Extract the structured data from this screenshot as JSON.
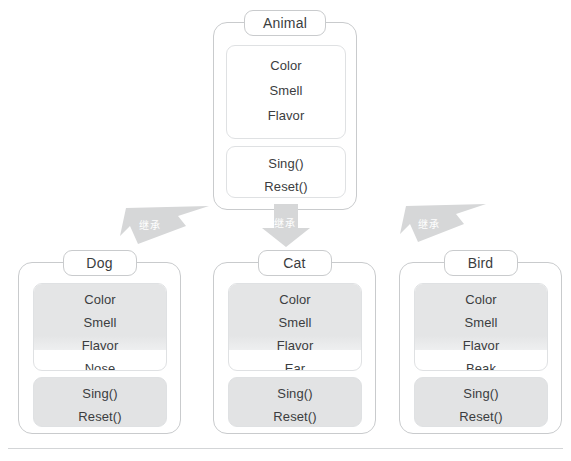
{
  "diagram": {
    "type": "uml-class-inheritance",
    "background_color": "#ffffff",
    "box_border_color": "#c9cbcd",
    "inherited_fill_color": "#e4e5e6",
    "arrow_fill_color": "#d6d7d8",
    "text_color": "#3b3d40"
  },
  "base_class": {
    "name": "Animal",
    "attributes": [
      "Color",
      "Smell",
      "Flavor"
    ],
    "methods": [
      "Sing()",
      "Reset()"
    ]
  },
  "derived_classes": [
    {
      "name": "Dog",
      "inherited_attributes": [
        "Color",
        "Smell",
        "Flavor"
      ],
      "own_attributes": [
        "Nose"
      ],
      "inherited_methods": [
        "Sing()",
        "Reset()"
      ]
    },
    {
      "name": "Cat",
      "inherited_attributes": [
        "Color",
        "Smell",
        "Flavor"
      ],
      "own_attributes": [
        "Ear"
      ],
      "inherited_methods": [
        "Sing()",
        "Reset()"
      ]
    },
    {
      "name": "Bird",
      "inherited_attributes": [
        "Color",
        "Smell",
        "Flavor"
      ],
      "own_attributes": [
        "Beak"
      ],
      "inherited_methods": [
        "Sing()",
        "Reset()"
      ]
    }
  ],
  "relations": [
    {
      "label": "继承",
      "from": "Animal",
      "to": "Dog",
      "direction": "down-left"
    },
    {
      "label": "继承",
      "from": "Animal",
      "to": "Cat",
      "direction": "down"
    },
    {
      "label": "继承",
      "from": "Animal",
      "to": "Bird",
      "direction": "down-left"
    }
  ]
}
